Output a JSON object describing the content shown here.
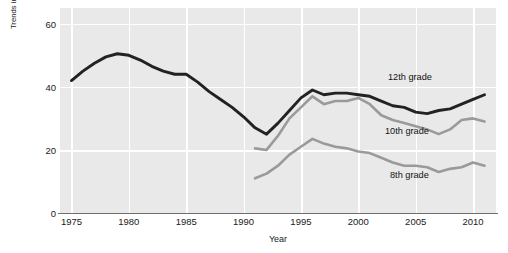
{
  "chart_data": {
    "type": "line",
    "title": "",
    "xlabel": "Year",
    "ylabel": "Trends in the percent of U.S. adolescents who have used an illicit drug in the last 12 months",
    "xlim": [
      1974,
      2012
    ],
    "ylim": [
      0,
      65
    ],
    "yticks": [
      0,
      20,
      40,
      60
    ],
    "xticks": [
      1975,
      1980,
      1985,
      1990,
      1995,
      2000,
      2005,
      2010
    ],
    "grid": true,
    "legend_position": "inline-annotations",
    "colors": {
      "12th grade": "#222222",
      "10th grade": "#9a9a9a",
      "8th grade": "#9a9a9a",
      "plot_background": "#e9e9e9",
      "gridline": "#ffffff",
      "axis": "#6e6e6e",
      "text": "#1a1a1a"
    },
    "series": [
      {
        "name": "12th grade",
        "color": "#222222",
        "x": [
          1975,
          1976,
          1977,
          1978,
          1979,
          1980,
          1981,
          1982,
          1983,
          1984,
          1985,
          1986,
          1987,
          1988,
          1989,
          1990,
          1991,
          1992,
          1993,
          1994,
          1995,
          1996,
          1997,
          1998,
          1999,
          2000,
          2001,
          2002,
          2003,
          2004,
          2005,
          2006,
          2007,
          2008,
          2009,
          2010,
          2011
        ],
        "values": [
          42.0,
          45.0,
          47.5,
          49.5,
          50.5,
          50.0,
          48.5,
          46.5,
          45.0,
          44.0,
          44.0,
          41.5,
          38.5,
          36.0,
          33.5,
          30.5,
          27.0,
          25.0,
          28.5,
          32.5,
          36.5,
          39.0,
          37.5,
          38.0,
          38.0,
          37.5,
          37.0,
          35.5,
          34.0,
          33.5,
          32.0,
          31.5,
          32.5,
          33.0,
          34.5,
          36.0,
          37.5
        ]
      },
      {
        "name": "10th grade",
        "color": "#9a9a9a",
        "x": [
          1991,
          1992,
          1993,
          1994,
          1995,
          1996,
          1997,
          1998,
          1999,
          2000,
          2001,
          2002,
          2003,
          2004,
          2005,
          2006,
          2007,
          2008,
          2009,
          2010,
          2011
        ],
        "values": [
          20.5,
          20.0,
          24.5,
          30.0,
          33.5,
          37.0,
          34.5,
          35.5,
          35.5,
          36.5,
          34.5,
          31.0,
          29.5,
          28.5,
          27.5,
          26.5,
          25.0,
          26.5,
          29.5,
          30.0,
          29.0
        ]
      },
      {
        "name": "8th grade",
        "color": "#9a9a9a",
        "x": [
          1991,
          1992,
          1993,
          1994,
          1995,
          1996,
          1997,
          1998,
          1999,
          2000,
          2001,
          2002,
          2003,
          2004,
          2005,
          2006,
          2007,
          2008,
          2009,
          2010,
          2011
        ],
        "values": [
          11.0,
          12.5,
          15.0,
          18.5,
          21.0,
          23.5,
          22.0,
          21.0,
          20.5,
          19.5,
          19.0,
          17.5,
          16.0,
          15.0,
          15.0,
          14.5,
          13.0,
          14.0,
          14.5,
          16.0,
          15.0
        ]
      }
    ],
    "annotations": [
      {
        "text": "12th grade",
        "series": "12th grade"
      },
      {
        "text": "10th grade",
        "series": "10th grade"
      },
      {
        "text": "8th grade",
        "series": "8th grade"
      }
    ]
  }
}
